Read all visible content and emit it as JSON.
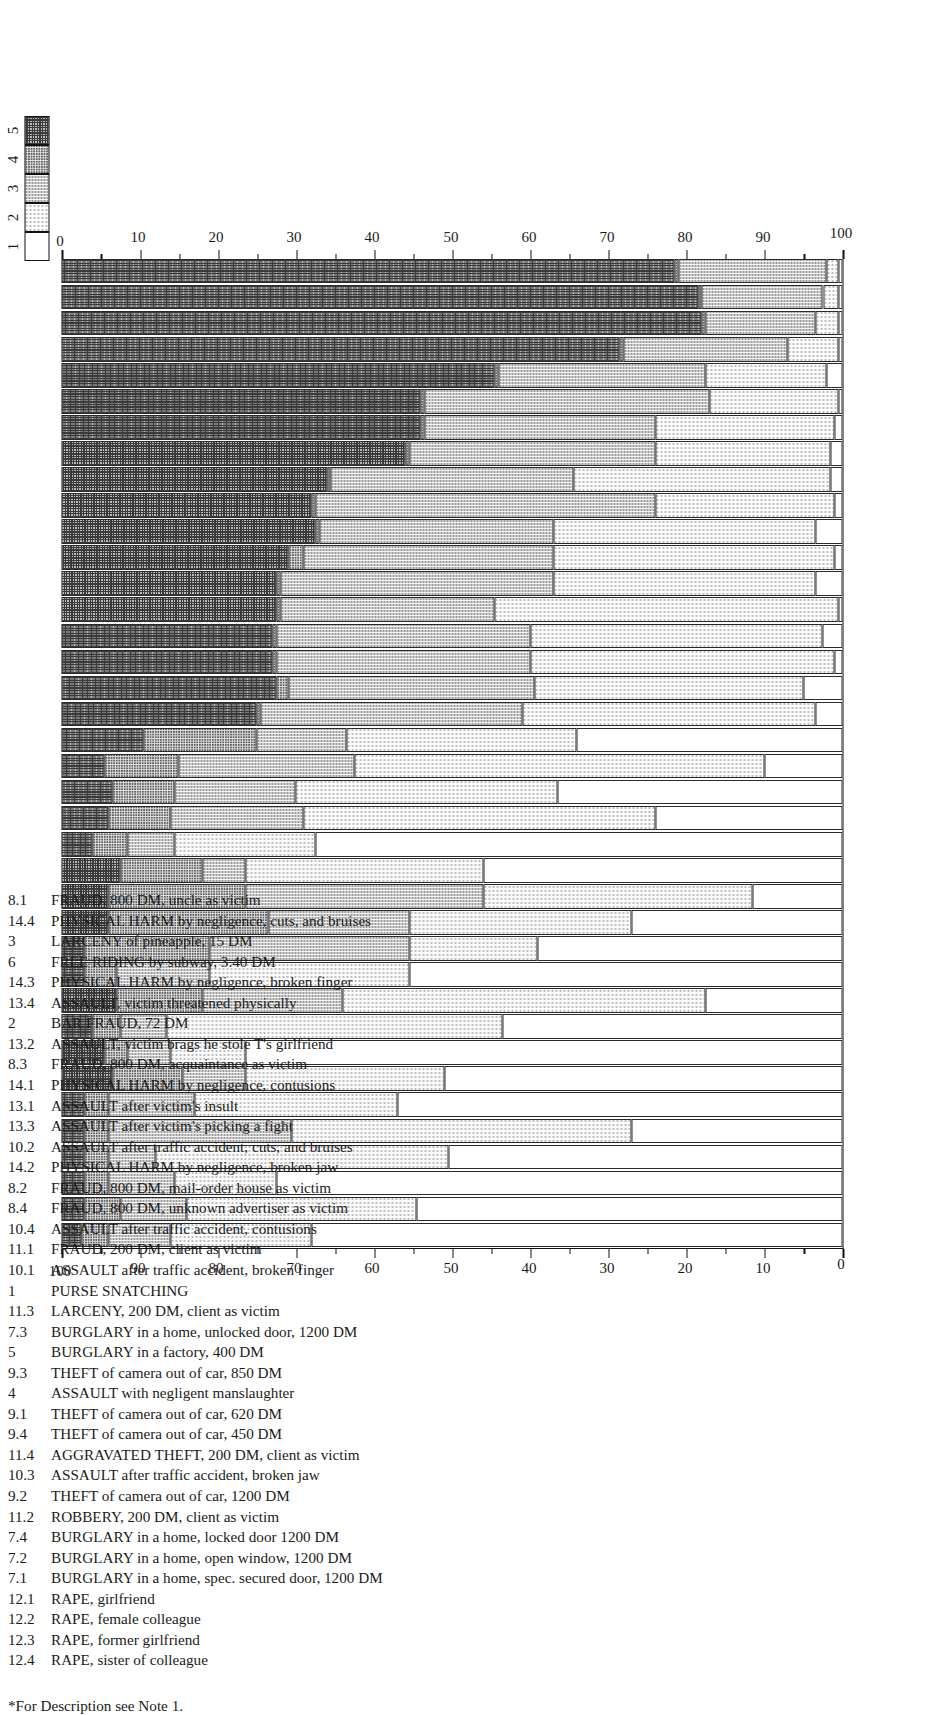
{
  "figure": {
    "footnote": "*For Description see Note 1.",
    "legend": {
      "title": "",
      "entries": [
        "1",
        "2",
        "3",
        "4",
        "5"
      ]
    },
    "axis": {
      "top_ticks": [
        "0",
        "10",
        "20",
        "30",
        "40",
        "50",
        "60",
        "70",
        "80",
        "90",
        "100"
      ],
      "bottom_ticks": [
        "0",
        "10",
        "20",
        "30",
        "40",
        "50",
        "60",
        "70",
        "80",
        "90",
        "100"
      ],
      "range": [
        0,
        100
      ],
      "minor_step": 5
    }
  },
  "chart_data": {
    "type": "bar",
    "orientation": "horizontal-stacked",
    "title": "",
    "xlabel": "",
    "ylabel": "",
    "xlim": [
      0,
      100
    ],
    "grid": false,
    "legend_position": "top-left",
    "series": [
      {
        "name": "1",
        "pattern": "blank"
      },
      {
        "name": "2",
        "pattern": "fine-dots"
      },
      {
        "name": "3",
        "pattern": "light-dots"
      },
      {
        "name": "4",
        "pattern": "medium-dots"
      },
      {
        "name": "5",
        "pattern": "dense-checker"
      }
    ],
    "categories": [
      {
        "code": "8.1",
        "label": "FRAUD, 800 DM, uncle as victim",
        "values": [
          68.0,
          18.0,
          8.0,
          3.5,
          2.5
        ]
      },
      {
        "code": "14.4",
        "label": "PHYSICAL HARM by negligence, cuts, and bruises",
        "values": [
          54.5,
          29.5,
          8.5,
          4.5,
          3.0
        ]
      },
      {
        "code": "3",
        "label": "LARCENY of pineapple, 15 DM",
        "values": [
          72.5,
          13.0,
          8.5,
          3.0,
          3.0
        ]
      },
      {
        "code": "6",
        "label": "FREE RIDING by subway, 3.40 DM",
        "values": [
          50.5,
          37.5,
          6.0,
          3.0,
          3.0
        ]
      },
      {
        "code": "14.3",
        "label": "PHYSICAL HARM by negligence, broken finger",
        "values": [
          27.0,
          43.5,
          23.5,
          3.0,
          3.0
        ]
      },
      {
        "code": "13.4",
        "label": "ASSAULT, victim threatened physically",
        "values": [
          57.0,
          26.0,
          11.0,
          3.0,
          3.0
        ]
      },
      {
        "code": "2",
        "label": "BAR FRAUD, 72 DM",
        "values": [
          51.0,
          25.5,
          8.0,
          9.0,
          6.5
        ]
      },
      {
        "code": "13.2",
        "label": "ASSAULT, victim brags he stole T's girlfriend",
        "values": [
          76.5,
          9.5,
          5.5,
          3.0,
          5.5
        ]
      },
      {
        "code": "8.3",
        "label": "FRAUD, 800 DM, acquaintance as victim",
        "values": [
          43.5,
          43.0,
          6.0,
          3.5,
          4.0
        ]
      },
      {
        "code": "14.1",
        "label": "PHYSICAL HARM by negligence, contusions",
        "values": [
          17.5,
          46.5,
          18.0,
          11.0,
          7.0
        ]
      },
      {
        "code": "13.1",
        "label": "ASSAULT after victim's insult",
        "values": [
          55.5,
          25.5,
          12.0,
          4.0,
          3.0
        ]
      },
      {
        "code": "13.3",
        "label": "ASSAULT after victim's picking a fight",
        "values": [
          39.0,
          16.5,
          25.5,
          16.0,
          3.0
        ]
      },
      {
        "code": "10.2",
        "label": "ASSAULT after traffic accident, cuts, and bruises",
        "values": [
          27.0,
          28.5,
          18.0,
          20.5,
          6.0
        ]
      },
      {
        "code": "14.2",
        "label": "PHYSICAL HARM by negligence, broken jaw",
        "values": [
          11.5,
          34.5,
          30.5,
          17.5,
          6.0
        ]
      },
      {
        "code": "8.2",
        "label": "FRAUD, 800 DM, mail-order house as victim",
        "values": [
          46.0,
          30.5,
          5.5,
          10.5,
          7.5
        ]
      },
      {
        "code": "8.4",
        "label": "FRAUD, 800 DM, unknown advertiser as victim",
        "values": [
          67.5,
          18.0,
          6.0,
          4.5,
          4.0
        ]
      },
      {
        "code": "10.4",
        "label": "ASSAULT after traffic accident, contusions",
        "values": [
          24.0,
          45.0,
          17.0,
          8.0,
          6.0
        ]
      },
      {
        "code": "11.1",
        "label": "FRAUD, 200 DM, client as victim",
        "values": [
          36.5,
          33.5,
          15.5,
          8.0,
          6.5
        ]
      },
      {
        "code": "10.1",
        "label": "ASSAULT after traffic accident, broken finger",
        "values": [
          10.0,
          52.5,
          22.5,
          9.5,
          5.5
        ]
      },
      {
        "code": "1",
        "label": "PURSE SNATCHING",
        "values": [
          34.0,
          29.5,
          11.5,
          14.5,
          10.5
        ]
      },
      {
        "code": "11.3",
        "label": "LARCENY, 200 DM, client as victim",
        "values": [
          3.5,
          37.5,
          33.5,
          0.5,
          25.0
        ]
      },
      {
        "code": "7.3",
        "label": "BURGLARY in a home, unlocked door, 1200 DM",
        "values": [
          5.0,
          34.5,
          31.5,
          1.5,
          27.5
        ]
      },
      {
        "code": "5",
        "label": "BURGLARY in a factory, 400 DM",
        "values": [
          1.0,
          39.0,
          32.5,
          0.5,
          27.0
        ]
      },
      {
        "code": "9.3",
        "label": "THEFT of camera out of car, 850 DM",
        "values": [
          2.5,
          37.5,
          32.5,
          0.5,
          27.0
        ]
      },
      {
        "code": "4",
        "label": "ASSAULT with negligent manslaughter",
        "values": [
          0.5,
          44.0,
          27.5,
          0.5,
          27.5
        ]
      },
      {
        "code": "9.1",
        "label": "THEFT of camera out of car, 620 DM",
        "values": [
          3.5,
          33.5,
          35.0,
          0.5,
          27.5
        ]
      },
      {
        "code": "9.4",
        "label": "THEFT of camera out of car, 450 DM",
        "values": [
          1.0,
          36.0,
          32.0,
          2.0,
          29.0
        ]
      },
      {
        "code": "11.4",
        "label": "AGGRAVATED THEFT, 200 DM, client as victim",
        "values": [
          3.5,
          33.5,
          30.0,
          0.5,
          32.5
        ]
      },
      {
        "code": "10.3",
        "label": "ASSAULT after traffic accident, broken jaw",
        "values": [
          1.0,
          23.0,
          43.5,
          0.5,
          32.0
        ]
      },
      {
        "code": "9.2",
        "label": "THEFT of camera out of car, 1200 DM",
        "values": [
          1.5,
          33.0,
          31.0,
          0.5,
          34.0
        ]
      },
      {
        "code": "11.2",
        "label": "ROBBERY, 200 DM, client as victim",
        "values": [
          1.5,
          22.5,
          31.5,
          0.5,
          44.0
        ]
      },
      {
        "code": "7.4",
        "label": "BURGLARY in a home, locked door 1200 DM",
        "values": [
          1.0,
          23.0,
          29.5,
          0.5,
          46.0
        ]
      },
      {
        "code": "7.2",
        "label": "BURGLARY in a home, open window, 1200 DM",
        "values": [
          0.5,
          16.5,
          36.5,
          0.5,
          46.0
        ]
      },
      {
        "code": "7.1",
        "label": "BURGLARY in a home, spec. secured door, 1200 DM",
        "values": [
          2.0,
          15.5,
          26.5,
          0.5,
          55.5
        ]
      },
      {
        "code": "12.1",
        "label": "RAPE, girlfriend",
        "values": [
          0.5,
          6.5,
          21.0,
          0.5,
          71.5
        ]
      },
      {
        "code": "12.2",
        "label": "RAPE, female colleague",
        "values": [
          0.5,
          3.0,
          14.0,
          0.5,
          82.0
        ]
      },
      {
        "code": "12.3",
        "label": "RAPE, former girlfriend",
        "values": [
          0.5,
          2.0,
          15.5,
          0.5,
          81.5
        ]
      },
      {
        "code": "12.4",
        "label": "RAPE, sister of colleague",
        "values": [
          0.5,
          1.5,
          19.0,
          0.5,
          78.5
        ]
      }
    ]
  }
}
